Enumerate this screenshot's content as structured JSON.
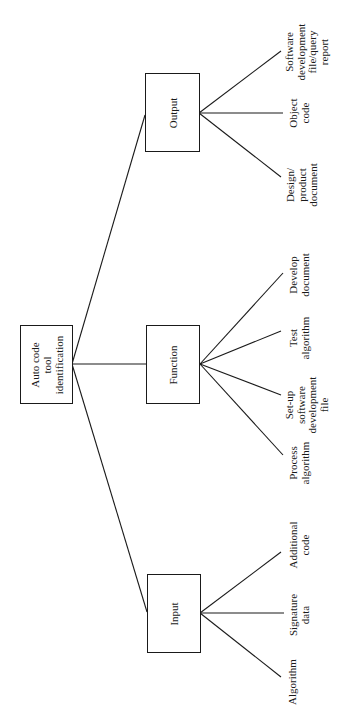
{
  "diagram": {
    "orientation": "rotated -90deg (reads bottom-to-top)",
    "root": {
      "label": "Auto code\ntool\nidentification"
    },
    "branches": [
      {
        "id": "output",
        "label": "Output",
        "children": [
          {
            "label": "Software\ndevelopment\nfile/query\nreport"
          },
          {
            "label": "Object\ncode"
          },
          {
            "label": "Design/\nproduct\ndocument"
          }
        ]
      },
      {
        "id": "function",
        "label": "Function",
        "children": [
          {
            "label": "Develop\ndocument"
          },
          {
            "label": "Test\nalgorithm"
          },
          {
            "label": "Set-up\nsoftware\ndevelopment\nfile"
          },
          {
            "label": "Process\nalgorithm"
          }
        ]
      },
      {
        "id": "input",
        "label": "Input",
        "children": [
          {
            "label": "Additional\ncode"
          },
          {
            "label": "Signature\ndata"
          },
          {
            "label": "Algorithm"
          }
        ]
      }
    ],
    "colors": {
      "line": "#1a1a1a",
      "background": "#ffffff"
    }
  }
}
